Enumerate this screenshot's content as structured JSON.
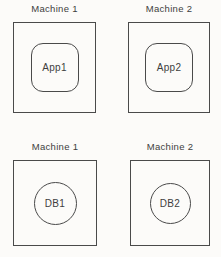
{
  "diagrams": [
    {
      "machine_label": "Machine 1",
      "node_label": "App1",
      "node_shape": "rounded-square"
    },
    {
      "machine_label": "Machine 2",
      "node_label": "App2",
      "node_shape": "rounded-square"
    },
    {
      "machine_label": "Machine 1",
      "node_label": "DB1",
      "node_shape": "circle"
    },
    {
      "machine_label": "Machine 2",
      "node_label": "DB2",
      "node_shape": "circle"
    }
  ],
  "colors": {
    "stroke": "#4a4a4a",
    "text": "#3e3e3e",
    "background": "#fcfbf9"
  }
}
